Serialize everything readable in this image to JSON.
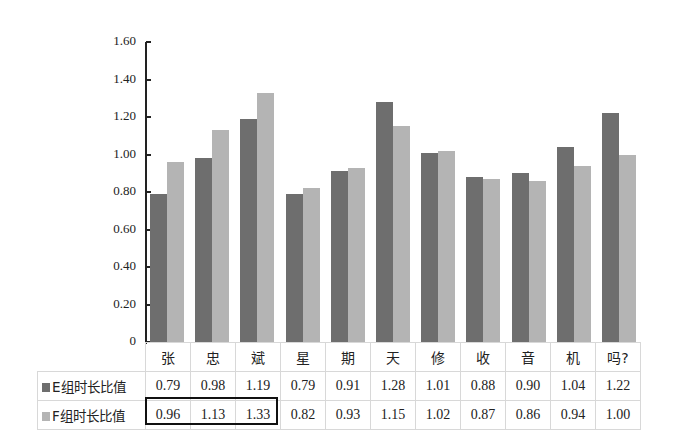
{
  "chart_data": {
    "type": "bar",
    "title": "",
    "xlabel": "",
    "ylabel": "",
    "ylim": [
      0,
      1.6
    ],
    "yticks": [
      "0",
      "0.20",
      "0.40",
      "0.60",
      "0.80",
      "1.00",
      "1.20",
      "1.40",
      "1.60"
    ],
    "grid": false,
    "legend_position": "data-table",
    "categories": [
      "张",
      "忠",
      "斌",
      "星",
      "期",
      "天",
      "修",
      "收",
      "音",
      "机",
      "吗?"
    ],
    "series": [
      {
        "name": "E组时长比值",
        "color": "#6e6e6e",
        "values": [
          0.79,
          0.98,
          1.19,
          0.79,
          0.91,
          1.28,
          1.01,
          0.88,
          0.9,
          1.04,
          1.22
        ]
      },
      {
        "name": "F组时长比值",
        "color": "#b4b4b4",
        "values": [
          0.96,
          1.13,
          1.33,
          0.82,
          0.93,
          1.15,
          1.02,
          0.87,
          0.86,
          0.94,
          1.0
        ]
      }
    ],
    "table": {
      "display_values": [
        [
          "0.79",
          "0.98",
          "1.19",
          "0.79",
          "0.91",
          "1.28",
          "1.01",
          "0.88",
          "0.90",
          "1.04",
          "1.22"
        ],
        [
          "0.96",
          "1.13",
          "1.33",
          "0.82",
          "0.93",
          "1.15",
          "1.02",
          "0.87",
          "0.86",
          "0.94",
          "1.00"
        ]
      ],
      "highlight": {
        "series": 1,
        "from_category": 0,
        "to_category": 2
      }
    }
  }
}
